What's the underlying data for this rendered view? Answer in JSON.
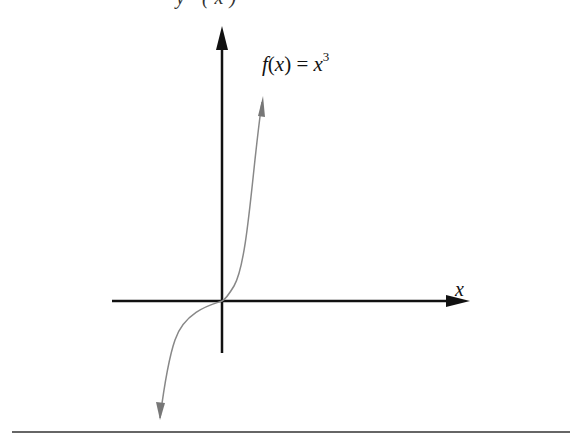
{
  "diagram": {
    "top_cut_text": "y (x)",
    "function_label": {
      "name": "f",
      "arg": "x",
      "rhs_base": "x",
      "rhs_exp": "3"
    },
    "x_axis_label": "x",
    "colors": {
      "axes": "#111111",
      "curve": "#888888",
      "rule": "#333333"
    }
  }
}
